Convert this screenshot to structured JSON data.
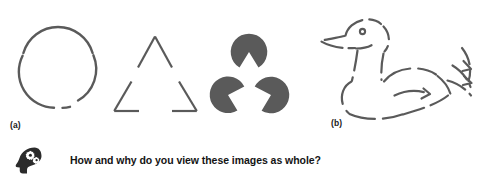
{
  "figure": {
    "caption_a": "(a)",
    "caption_b": "(b)",
    "prompt": "How and why do you view these images as whole?",
    "prompt_icon": "head-with-gears-icon",
    "background_color": "#ffffff",
    "stroke_color": "#5a5a5a",
    "fill_color": "#5a5a5a",
    "text_color": "#141414"
  },
  "panel_a": {
    "label": "(a)",
    "shapes": [
      {
        "name": "broken-circle",
        "type": "circle-with-gaps",
        "center": [
          58,
          72
        ],
        "radius": 36,
        "stroke_width": 2.4,
        "arcs_degrees": [
          [
            196,
            260
          ],
          [
            284,
            350
          ],
          [
            10,
            76
          ],
          [
            100,
            170
          ]
        ]
      },
      {
        "name": "broken-triangle",
        "type": "triangle-with-gaps",
        "vertices": [
          [
            155,
            36
          ],
          [
            114,
            111
          ],
          [
            197,
            111
          ]
        ],
        "stroke_width": 2.2,
        "gap_fraction": 0.3
      },
      {
        "name": "kanizsa-triangle",
        "type": "pacman-discs",
        "disc_radius": 17.5,
        "discs": [
          {
            "center": [
              249,
              52
            ],
            "wedge_direction_degrees": 90
          },
          {
            "center": [
              228,
              95
            ],
            "wedge_direction_degrees": 330
          },
          {
            "center": [
              271,
              95
            ],
            "wedge_direction_degrees": 210
          }
        ],
        "wedge_angle_degrees": 60
      }
    ]
  },
  "panel_b": {
    "label": "(b)",
    "shape": {
      "name": "dashed-duck-outline",
      "type": "broken-contour-drawing",
      "subject": "duck",
      "stroke_width": 2.2,
      "dash_pattern": [
        18,
        7
      ]
    }
  }
}
